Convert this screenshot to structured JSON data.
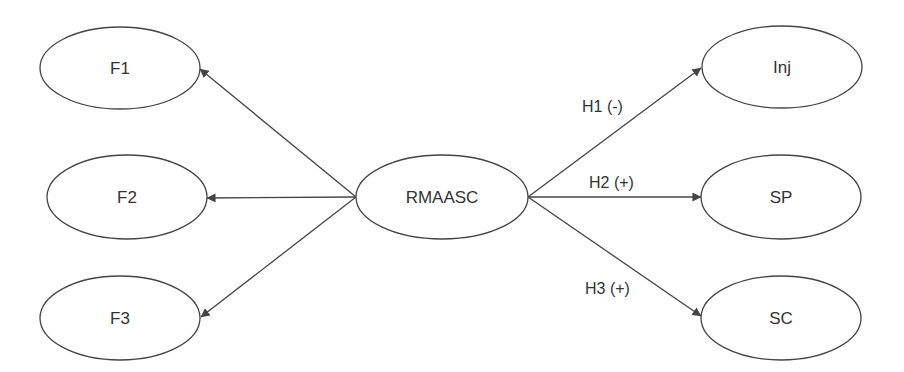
{
  "diagram": {
    "type": "path-model",
    "colors": {
      "stroke": "#444444",
      "text": "#333333",
      "background": "#ffffff"
    },
    "nodes": [
      {
        "id": "F1",
        "label": "F1",
        "cx": 120,
        "cy": 68,
        "rx": 80,
        "ry": 41
      },
      {
        "id": "F2",
        "label": "F2",
        "cx": 127,
        "cy": 197,
        "rx": 80,
        "ry": 42
      },
      {
        "id": "F3",
        "label": "F3",
        "cx": 120,
        "cy": 318,
        "rx": 80,
        "ry": 42
      },
      {
        "id": "RMAASC",
        "label": "RMAASC",
        "cx": 442,
        "cy": 197,
        "rx": 86,
        "ry": 42
      },
      {
        "id": "Inj",
        "label": "Inj",
        "cx": 782,
        "cy": 67,
        "rx": 80,
        "ry": 41
      },
      {
        "id": "SP",
        "label": "SP",
        "cx": 781,
        "cy": 197,
        "rx": 80,
        "ry": 42
      },
      {
        "id": "SC",
        "label": "SC",
        "cx": 781,
        "cy": 318,
        "rx": 80,
        "ry": 42
      }
    ],
    "edges": [
      {
        "from": "RMAASC",
        "to": "F1",
        "label": ""
      },
      {
        "from": "RMAASC",
        "to": "F2",
        "label": ""
      },
      {
        "from": "RMAASC",
        "to": "F3",
        "label": ""
      },
      {
        "from": "RMAASC",
        "to": "Inj",
        "label": "H1 (-)"
      },
      {
        "from": "RMAASC",
        "to": "SP",
        "label": "H2 (+)"
      },
      {
        "from": "RMAASC",
        "to": "SC",
        "label": "H3 (+)"
      }
    ],
    "edge_labels": {
      "h1": "H1 (-)",
      "h2": "H2 (+)",
      "h3": "H3 (+)"
    }
  }
}
